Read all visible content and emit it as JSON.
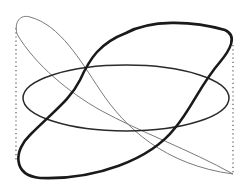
{
  "diagram": {
    "colors": {
      "background": "#ffffff",
      "thick_curve": "#1a1a1a",
      "ellipse": "#333333",
      "thin_curve": "#777777",
      "guides": "#555555"
    },
    "guides": [
      {
        "x": 16,
        "y1": 28,
        "y2": 160
      },
      {
        "x": 233,
        "y1": 45,
        "y2": 173
      }
    ]
  }
}
